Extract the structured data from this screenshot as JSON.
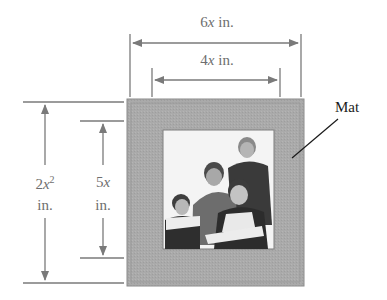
{
  "figure": {
    "mat_label": "Mat",
    "dimensions": {
      "outer_width": {
        "coef": "6",
        "var": "x",
        "unit": " in."
      },
      "inner_width": {
        "coef": "4",
        "var": "x",
        "unit": " in."
      },
      "outer_height": {
        "coef": "2",
        "var": "x",
        "exp": "2",
        "unit": "in."
      },
      "inner_height": {
        "coef": "5",
        "var": "x",
        "unit": "in."
      }
    },
    "colors": {
      "mat": "#a9a9a9",
      "mat_border": "#8a8a8a",
      "dimension_lines": "#7a7a7a",
      "photo_bg": "#f4f4f4"
    },
    "photo": {
      "description": "family portrait of four people"
    }
  }
}
